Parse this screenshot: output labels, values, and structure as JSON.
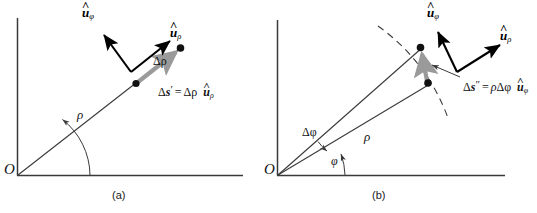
{
  "figure": {
    "background_color": "#ffffff",
    "line_color": "#3a3a3a",
    "vector_color": "#000000",
    "gray_arrow_color": "#9a9a9a",
    "text_color": "#111111"
  },
  "panel_a": {
    "caption": "(a)",
    "origin_label": "O",
    "radius_label": "ρ",
    "delta_rho_label": "Δρ",
    "unit_vector_phi": {
      "hat": "˄",
      "base": "u",
      "sub": "φ"
    },
    "unit_vector_rho": {
      "hat": "˄",
      "base": "u",
      "sub": "ρ"
    },
    "displacement_equation": {
      "lhs_delta": "Δ",
      "lhs_s": "s",
      "lhs_prime": "′",
      "equals": "=",
      "rhs_delta_rho": "Δρ",
      "rhs_hat": "˄",
      "rhs_u": "u",
      "rhs_sub": "ρ"
    }
  },
  "panel_b": {
    "caption": "(b)",
    "origin_label": "O",
    "radius_label": "ρ",
    "phi_label": "φ",
    "delta_phi_label": "Δφ",
    "unit_vector_phi": {
      "hat": "˄",
      "base": "u",
      "sub": "φ"
    },
    "unit_vector_rho": {
      "hat": "˄",
      "base": "u",
      "sub": "ρ"
    },
    "displacement_equation": {
      "lhs_delta": "Δ",
      "lhs_s": "s",
      "lhs_prime": "″",
      "equals": "=",
      "rhs_rho": "ρ",
      "rhs_delta_phi": "Δφ",
      "rhs_hat": "˄",
      "rhs_u": "u",
      "rhs_sub": "φ"
    }
  }
}
